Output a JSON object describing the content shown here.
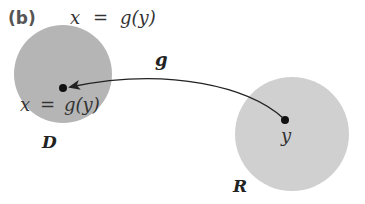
{
  "figure": {
    "panel_label": "(b)",
    "title_equation": {
      "lhs": "x",
      "eq": "=",
      "rhs": "g(y)"
    },
    "domain_set": {
      "name": "D",
      "point_label_lhs": "x",
      "point_label_eq": "=",
      "point_label_rhs": "g(y)",
      "fill_color": "#b3b3b3"
    },
    "range_set": {
      "name": "R",
      "point_label": "y",
      "fill_color": "#cfcfcf"
    },
    "mapping": {
      "name": "g",
      "direction": "from R to D",
      "stroke_color": "#222222"
    }
  }
}
